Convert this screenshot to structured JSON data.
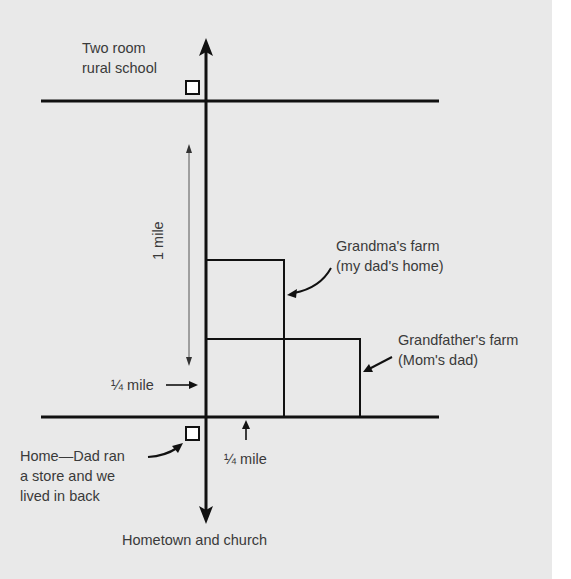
{
  "diagram": {
    "type": "hand-drawn map diagram",
    "colors": {
      "background": "#e9e9e9",
      "line": "#111111",
      "text": "#3a3a3a"
    },
    "labels": {
      "school_line1": "Two room",
      "school_line2": "rural school",
      "one_mile": "1 mile",
      "grandma_line1": "Grandma's farm",
      "grandma_line2": "(my dad's home)",
      "grandfather_line1": "Grandfather's farm",
      "grandfather_line2": "(Mom's dad)",
      "quarter_mile_left": "¼ mile",
      "quarter_mile_bottom": "¼ mile",
      "home_line1": "Home—Dad ran",
      "home_line2": "a store and we",
      "home_line3": "lived in back",
      "hometown": "Hometown and church"
    },
    "elements": [
      {
        "name": "north-south-road",
        "kind": "vertical line with arrows both ends"
      },
      {
        "name": "north-road",
        "kind": "horizontal line"
      },
      {
        "name": "south-road",
        "kind": "horizontal line"
      },
      {
        "name": "school",
        "kind": "square marker"
      },
      {
        "name": "home",
        "kind": "square marker"
      },
      {
        "name": "grandma-farm",
        "kind": "rectangle"
      },
      {
        "name": "grandfather-farm",
        "kind": "rectangle"
      }
    ]
  }
}
